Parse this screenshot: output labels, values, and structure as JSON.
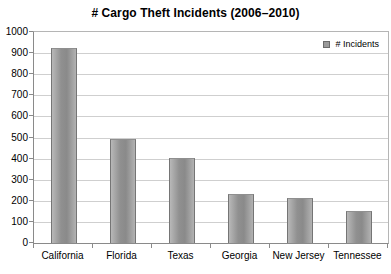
{
  "header": {
    "title": "# Cargo Theft Incidents (2006–2010)"
  },
  "legend": {
    "label": "# Incidents",
    "marker_color": "#9a9a9a"
  },
  "chart_data": {
    "type": "bar",
    "title": "# Cargo Theft Incidents (2006–2010)",
    "series_name": "# Incidents",
    "categories": [
      "California",
      "Florida",
      "Texas",
      "Georgia",
      "New Jersey",
      "Tennessee"
    ],
    "values": [
      925,
      495,
      405,
      230,
      215,
      150
    ],
    "xlabel": "",
    "ylabel": "",
    "ylim": [
      0,
      1000
    ],
    "yticks": [
      0,
      100,
      200,
      300,
      400,
      500,
      600,
      700,
      800,
      900,
      1000
    ],
    "grid": true,
    "legend_position": "top-right",
    "bar_color": "#9a9a9a",
    "bar_border_color": "#757575",
    "grid_color": "#cfcfcf",
    "axis_color": "#8a8a8a",
    "background_color": "#ffffff",
    "text_color": "#000000"
  }
}
